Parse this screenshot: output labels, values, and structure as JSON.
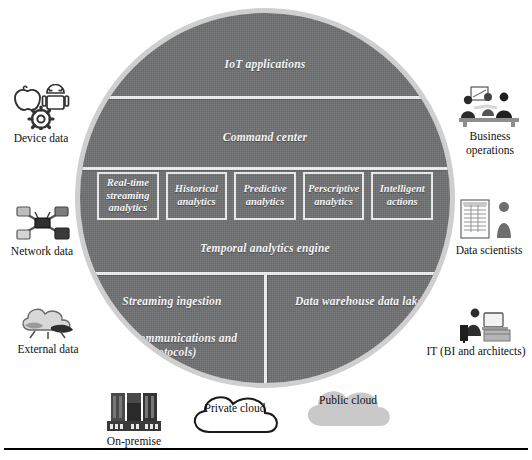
{
  "diagram": {
    "colors": {
      "circle_fill": "#6f7173",
      "circle_halo": "#cfcfcf",
      "divider": "#f2f2f2",
      "label_text": "#ffffff",
      "outer_text": "#111111",
      "public_cloud_fill": "#c9c9c9"
    },
    "bands": [
      {
        "id": "iot-applications",
        "label": "IoT applications"
      },
      {
        "id": "command-center",
        "label": "Command center"
      },
      {
        "id": "temporal-analytics-engine",
        "label": "Temporal analytics engine"
      }
    ],
    "analytics_boxes": [
      {
        "id": "real-time-streaming-analytics",
        "label": "Real-time streaming analytics"
      },
      {
        "id": "historical-analytics",
        "label": "Historical analytics"
      },
      {
        "id": "predictive-analytics",
        "label": "Predictive analytics"
      },
      {
        "id": "perscriptive-analytics",
        "label": "Perscriptive analytics"
      },
      {
        "id": "intelligent-actions",
        "label": "Intelligent actions"
      }
    ],
    "bottom_segments": [
      {
        "id": "streaming-ingestion",
        "title": "Streaming ingestion",
        "subtitle": "(IOT communications and protocols)"
      },
      {
        "id": "data-warehouse",
        "title": "Data warehouse data lake",
        "subtitle": ""
      }
    ],
    "left_sources": [
      {
        "id": "device-data",
        "label": "Device data",
        "icon": "device-apple-android-gear-icon"
      },
      {
        "id": "network-data",
        "label": "Network data",
        "icon": "network-router-icon"
      },
      {
        "id": "external-data",
        "label": "External data",
        "icon": "cloud-external-icon"
      }
    ],
    "right_consumers": [
      {
        "id": "business-operations",
        "label": "Business operations",
        "icon": "business-people-icon"
      },
      {
        "id": "data-scientists",
        "label": "Data scientists",
        "icon": "data-scientist-report-icon"
      },
      {
        "id": "it-bi-architects",
        "label": "IT (BI and architects)",
        "icon": "it-person-desk-icon"
      }
    ],
    "deployment_targets": [
      {
        "id": "on-premise",
        "label": "On-premise",
        "icon": "server-building-icon"
      },
      {
        "id": "private-cloud",
        "label": "Private cloud",
        "icon": "cloud-outline-icon"
      },
      {
        "id": "public-cloud",
        "label": "Public cloud",
        "icon": "cloud-filled-icon"
      }
    ]
  }
}
